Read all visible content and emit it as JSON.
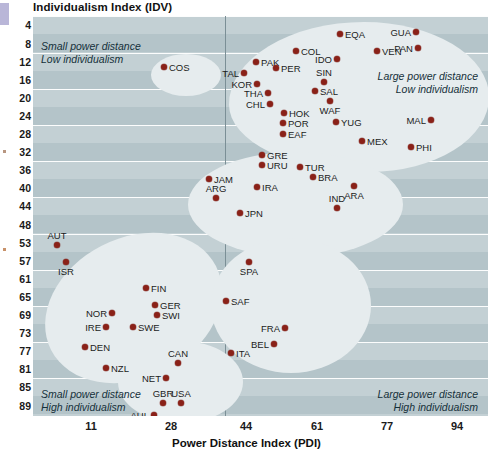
{
  "chart_data": {
    "type": "scatter",
    "title": "",
    "ylabel": "Individualism Index (IDV)",
    "xlabel": "Power Distance Index (PDI)",
    "xticks": [
      11,
      28,
      44,
      61,
      77,
      94,
      111
    ],
    "yticks": [
      4,
      8,
      12,
      16,
      20,
      24,
      28,
      32,
      36,
      40,
      44,
      48,
      53,
      57,
      61,
      65,
      69,
      73,
      77,
      81,
      85,
      89
    ],
    "xlim": [
      3,
      119
    ],
    "ylim": [
      2,
      91
    ],
    "grid": true,
    "legend": null,
    "y_axis_inverted": true,
    "annotations": [
      {
        "name": "top-left-quadrant",
        "text": "Small power distance\nLow individualism"
      },
      {
        "name": "top-right-quadrant",
        "text": "Large power distance\nLow individualism"
      },
      {
        "name": "bottom-left-quadrant",
        "text": "Small power distance\nHigh individualism"
      },
      {
        "name": "bottom-right-quadrant",
        "text": "Large power distance\nHigh individualism"
      }
    ],
    "points": [
      {
        "label": "COS",
        "x": 35,
        "y": 12,
        "lx": 164,
        "ly": 67,
        "pos": "r"
      },
      {
        "label": "EQA",
        "x": 62,
        "y": 5,
        "lx": 340,
        "ly": 34,
        "pos": "r"
      },
      {
        "label": "GUA",
        "x": 92,
        "y": 5,
        "lx": 416,
        "ly": 32,
        "pos": "l"
      },
      {
        "label": "COL",
        "x": 55,
        "y": 9,
        "lx": 296,
        "ly": 51,
        "pos": "r"
      },
      {
        "label": "VEN",
        "x": 71,
        "y": 9,
        "lx": 377,
        "ly": 51,
        "pos": "r"
      },
      {
        "label": "PAN",
        "x": 92,
        "y": 10,
        "lx": 418,
        "ly": 48,
        "pos": "l"
      },
      {
        "label": "PAK",
        "x": 47,
        "y": 12,
        "lx": 256,
        "ly": 62,
        "pos": "r"
      },
      {
        "label": "IDO",
        "x": 67,
        "y": 11,
        "lx": 337,
        "ly": 59,
        "pos": "l"
      },
      {
        "label": "TAL",
        "x": 45,
        "y": 14,
        "lx": 244,
        "ly": 73,
        "pos": "l"
      },
      {
        "label": "PER",
        "x": 53,
        "y": 13,
        "lx": 276,
        "ly": 68,
        "pos": "r"
      },
      {
        "label": "KOR",
        "x": 48,
        "y": 17,
        "lx": 257,
        "ly": 84,
        "pos": "l"
      },
      {
        "label": "SIN",
        "x": 65,
        "y": 18,
        "lx": 324,
        "ly": 82,
        "pos": "t"
      },
      {
        "label": "SAL",
        "x": 57,
        "y": 19,
        "lx": 315,
        "ly": 91,
        "pos": "r"
      },
      {
        "label": "THA",
        "x": 50,
        "y": 19,
        "lx": 268,
        "ly": 93,
        "pos": "l"
      },
      {
        "label": "WAF",
        "x": 67,
        "y": 20,
        "lx": 330,
        "ly": 101,
        "pos": "b"
      },
      {
        "label": "CHL",
        "x": 51,
        "y": 22,
        "lx": 270,
        "ly": 104,
        "pos": "l"
      },
      {
        "label": "HOK",
        "x": 55,
        "y": 24,
        "lx": 284,
        "ly": 113,
        "pos": "r"
      },
      {
        "label": "POR",
        "x": 51,
        "y": 26,
        "lx": 283,
        "ly": 123,
        "pos": "r"
      },
      {
        "label": "YUG",
        "x": 64,
        "y": 26,
        "lx": 336,
        "ly": 122,
        "pos": "r"
      },
      {
        "label": "MAL",
        "x": 93,
        "y": 25,
        "lx": 431,
        "ly": 120,
        "pos": "l"
      },
      {
        "label": "EAF",
        "x": 52,
        "y": 28,
        "lx": 283,
        "ly": 134,
        "pos": "r"
      },
      {
        "label": "MEX",
        "x": 69,
        "y": 29,
        "lx": 362,
        "ly": 141,
        "pos": "r"
      },
      {
        "label": "PHI",
        "x": 88,
        "y": 31,
        "lx": 411,
        "ly": 147,
        "pos": "r"
      },
      {
        "label": "GRE",
        "x": 54,
        "y": 33,
        "lx": 262,
        "ly": 155,
        "pos": "r"
      },
      {
        "label": "URU",
        "x": 54,
        "y": 35,
        "lx": 262,
        "ly": 165,
        "pos": "r"
      },
      {
        "label": "TUR",
        "x": 60,
        "y": 36,
        "lx": 300,
        "ly": 167,
        "pos": "r"
      },
      {
        "label": "JAM",
        "x": 41,
        "y": 38,
        "lx": 209,
        "ly": 179,
        "pos": "r"
      },
      {
        "label": "BRA",
        "x": 64,
        "y": 38,
        "lx": 313,
        "ly": 177,
        "pos": "r"
      },
      {
        "label": "IRA",
        "x": 52,
        "y": 40,
        "lx": 257,
        "ly": 187,
        "pos": "r"
      },
      {
        "label": "ARA",
        "x": 74,
        "y": 38,
        "lx": 354,
        "ly": 186,
        "pos": "b"
      },
      {
        "label": "ARG",
        "x": 46,
        "y": 44,
        "lx": 216,
        "ly": 198,
        "pos": "t"
      },
      {
        "label": "JPN",
        "x": 51,
        "y": 45,
        "lx": 240,
        "ly": 213,
        "pos": "r"
      },
      {
        "label": "IND",
        "x": 72,
        "y": 46,
        "lx": 337,
        "ly": 208,
        "pos": "t"
      },
      {
        "label": "AUT",
        "x": 11,
        "y": 53,
        "lx": 57,
        "ly": 245,
        "pos": "t"
      },
      {
        "label": "ISR",
        "x": 13,
        "y": 54,
        "lx": 66,
        "ly": 262,
        "pos": "b"
      },
      {
        "label": "SPA",
        "x": 57,
        "y": 51,
        "lx": 249,
        "ly": 262,
        "pos": "b"
      },
      {
        "label": "FIN",
        "x": 33,
        "y": 63,
        "lx": 146,
        "ly": 288,
        "pos": "r"
      },
      {
        "label": "SAF",
        "x": 49,
        "y": 65,
        "lx": 226,
        "ly": 301,
        "pos": "r"
      },
      {
        "label": "GER",
        "x": 35,
        "y": 67,
        "lx": 155,
        "ly": 305,
        "pos": "r"
      },
      {
        "label": "NOR",
        "x": 31,
        "y": 69,
        "lx": 112,
        "ly": 313,
        "pos": "l"
      },
      {
        "label": "SWI",
        "x": 34,
        "y": 68,
        "lx": 157,
        "ly": 315,
        "pos": "r"
      },
      {
        "label": "IRE",
        "x": 28,
        "y": 70,
        "lx": 106,
        "ly": 327,
        "pos": "l"
      },
      {
        "label": "SWE",
        "x": 31,
        "y": 71,
        "lx": 133,
        "ly": 327,
        "pos": "r"
      },
      {
        "label": "FRA",
        "x": 68,
        "y": 71,
        "lx": 285,
        "ly": 328,
        "pos": "l"
      },
      {
        "label": "BEL",
        "x": 65,
        "y": 75,
        "lx": 274,
        "ly": 344,
        "pos": "l"
      },
      {
        "label": "DEN",
        "x": 18,
        "y": 74,
        "lx": 85,
        "ly": 347,
        "pos": "r"
      },
      {
        "label": "ITA",
        "x": 50,
        "y": 76,
        "lx": 231,
        "ly": 353,
        "pos": "r"
      },
      {
        "label": "NZL",
        "x": 22,
        "y": 79,
        "lx": 106,
        "ly": 368,
        "pos": "r"
      },
      {
        "label": "CAN",
        "x": 39,
        "y": 80,
        "lx": 178,
        "ly": 363,
        "pos": "t"
      },
      {
        "label": "NET",
        "x": 38,
        "y": 80,
        "lx": 166,
        "ly": 378,
        "pos": "l"
      },
      {
        "label": "GBR",
        "x": 35,
        "y": 89,
        "lx": 163,
        "ly": 403,
        "pos": "t"
      },
      {
        "label": "AUL",
        "x": 36,
        "y": 90,
        "lx": 154,
        "ly": 415,
        "pos": "l"
      },
      {
        "label": "USA",
        "x": 40,
        "y": 91,
        "lx": 181,
        "ly": 403,
        "pos": "t"
      }
    ]
  }
}
